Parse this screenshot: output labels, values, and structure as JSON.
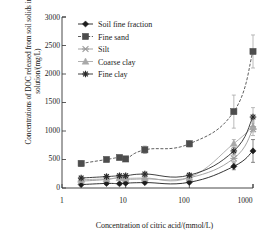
{
  "chart_data": {
    "type": "line",
    "title": "",
    "xlabel": "Concentration of citric acid/(mmol/L)",
    "ylabel": "Concentrations of DOC released from soil solids in solution/(mg/L)",
    "xscale": "log",
    "xlim": [
      1,
      1000
    ],
    "ylim": [
      0,
      3000
    ],
    "yticks": [
      0,
      500,
      1000,
      1500,
      2000,
      2500,
      3000
    ],
    "xticks": [
      1,
      10,
      100,
      1000
    ],
    "xtick_labels": [
      "1",
      "10",
      "100",
      "1000"
    ],
    "grid": false,
    "legend_position": "top-left",
    "series": [
      {
        "name": "Soil fine fraction",
        "marker": "diamond",
        "color": "#1c1c1c",
        "x": [
          2,
          5,
          8,
          10,
          20,
          100,
          500,
          1000
        ],
        "values": [
          60,
          80,
          75,
          85,
          95,
          100,
          380,
          650
        ],
        "errors": [
          20,
          20,
          20,
          20,
          20,
          25,
          60,
          200
        ]
      },
      {
        "name": "Fine sand",
        "marker": "square",
        "color": "#4d4d4d",
        "x": [
          2,
          5,
          8,
          10,
          20,
          100,
          500,
          1000
        ],
        "values": [
          430,
          500,
          535,
          510,
          670,
          775,
          1340,
          2395
        ],
        "errors": [
          50,
          35,
          35,
          35,
          65,
          55,
          290,
          290
        ]
      },
      {
        "name": "Silt",
        "marker": "x",
        "color": "#9a9a9a",
        "x": [
          2,
          5,
          8,
          10,
          20,
          100,
          500,
          1000
        ],
        "values": [
          120,
          150,
          185,
          155,
          160,
          180,
          520,
          1030
        ],
        "errors": [
          25,
          25,
          25,
          25,
          25,
          25,
          55,
          110
        ]
      },
      {
        "name": "Coarse clay",
        "marker": "triangle",
        "color": "#a8a8a8",
        "x": [
          2,
          5,
          8,
          10,
          20,
          100,
          500,
          1000
        ],
        "values": [
          145,
          160,
          175,
          170,
          175,
          185,
          780,
          1080
        ],
        "errors": [
          25,
          25,
          25,
          25,
          25,
          25,
          70,
          95
        ]
      },
      {
        "name": "Fine clay",
        "marker": "asterisk",
        "color": "#2b2b2b",
        "x": [
          2,
          5,
          8,
          10,
          20,
          100,
          500,
          1000
        ],
        "values": [
          175,
          200,
          215,
          215,
          245,
          225,
          650,
          1245
        ],
        "errors": [
          30,
          30,
          30,
          30,
          30,
          35,
          60,
          165
        ]
      }
    ]
  },
  "legend": {
    "items": [
      {
        "label": "Soil fine fraction"
      },
      {
        "label": "Fine sand"
      },
      {
        "label": "Silt"
      },
      {
        "label": "Coarse clay"
      },
      {
        "label": "Fine clay"
      }
    ]
  }
}
